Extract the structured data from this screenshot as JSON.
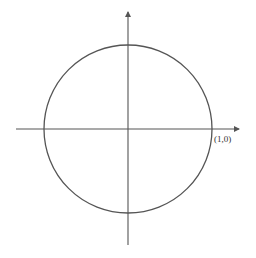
{
  "diagram": {
    "type": "unit-circle",
    "point_label": "(1,0)",
    "colors": {
      "circle": "#555555",
      "axes": "#555555",
      "text": "#333333",
      "background": "#ffffff"
    }
  }
}
